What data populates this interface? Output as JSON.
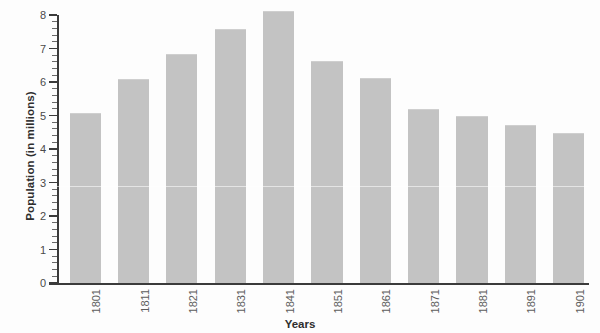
{
  "chart_data": {
    "type": "bar",
    "title": "",
    "xlabel": "Years",
    "ylabel": "Population (in millions)",
    "categories": [
      "1801",
      "1811",
      "1821",
      "1831",
      "1841",
      "1851",
      "1861",
      "1871",
      "1881",
      "1891",
      "1901"
    ],
    "values": [
      5.05,
      6.05,
      6.8,
      7.55,
      8.1,
      6.6,
      6.1,
      5.15,
      4.95,
      4.7,
      4.45
    ],
    "ylim": [
      0,
      8
    ],
    "ytick_labels": [
      "0",
      "1",
      "2",
      "3",
      "4",
      "5",
      "6",
      "7",
      "8"
    ],
    "ytick_values": [
      0,
      1,
      2,
      3,
      4,
      5,
      6,
      7,
      8
    ],
    "minor_ticks_per_interval": 4,
    "grid": false,
    "legend": false,
    "bar_color": "#c3c3c3",
    "axis_color": "#3b3b3b",
    "text_color": "#2e2e2e"
  }
}
